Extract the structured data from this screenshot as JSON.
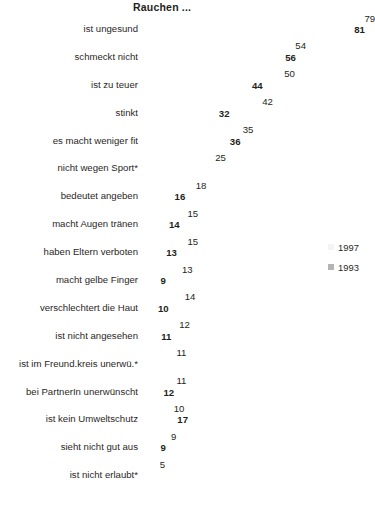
{
  "chart": {
    "title": "Rauchen ...",
    "legend": {
      "position": "right",
      "entries": [
        {
          "name": "1997",
          "color": "#f4f4f4"
        },
        {
          "name": "1993",
          "color": "#b4b4b4"
        }
      ]
    }
  },
  "chart_data": {
    "type": "bar",
    "title": "Rauchen ...",
    "xlabel": "",
    "ylabel": "",
    "orientation": "horizontal",
    "grid": false,
    "legend_position": "right",
    "xlim": [
      0,
      82
    ],
    "categories": [
      "ist ungesund",
      "schmeckt nicht",
      "ist zu teuer",
      "stinkt",
      "es macht weniger fit",
      "nicht wegen Sport*",
      "bedeutet angeben",
      "macht Augen tränen",
      "haben Eltern verboten",
      "macht gelbe Finger",
      "verschlechtert die Haut",
      "ist nicht angesehen",
      "ist im Freund.kreis unerwü.*",
      "bei PartnerIn unerwünscht",
      "ist kein Umweltschutz",
      "sieht nicht gut aus",
      "ist nicht erlaubt*"
    ],
    "series": [
      {
        "name": "1997",
        "color": "#f4f4f4",
        "values": [
          79,
          54,
          50,
          42,
          35,
          25,
          18,
          15,
          15,
          13,
          14,
          12,
          11,
          11,
          10,
          9,
          5
        ]
      },
      {
        "name": "1993",
        "color": "#b4b4b4",
        "values": [
          81,
          56,
          44,
          32,
          36,
          null,
          16,
          14,
          13,
          9,
          10,
          11,
          null,
          12,
          17,
          9,
          null
        ]
      }
    ]
  }
}
